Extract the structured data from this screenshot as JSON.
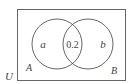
{
  "diagram": {
    "type": "venn",
    "universe_label": "U",
    "sets": [
      {
        "name": "A",
        "region_label": "a"
      },
      {
        "name": "B",
        "region_label": "b"
      }
    ],
    "intersection_label": "0.2",
    "colors": {
      "stroke": "#555555",
      "text": "#444444",
      "background": "#ffffff"
    }
  }
}
